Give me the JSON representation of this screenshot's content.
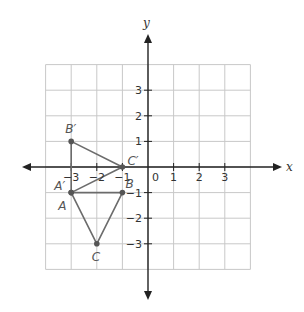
{
  "diagram": {
    "type": "coordinate-plane",
    "axes": {
      "x_label": "x",
      "y_label": "y",
      "origin_label": "0",
      "x_ticks": [
        {
          "value": -3,
          "label": "−3"
        },
        {
          "value": -2,
          "label": "−2"
        },
        {
          "value": -1,
          "label": "−1"
        },
        {
          "value": 1,
          "label": "1"
        },
        {
          "value": 2,
          "label": "2"
        },
        {
          "value": 3,
          "label": "3"
        }
      ],
      "y_ticks": [
        {
          "value": 3,
          "label": "3"
        },
        {
          "value": 2,
          "label": "2"
        },
        {
          "value": 1,
          "label": "1"
        },
        {
          "value": -1,
          "label": "−1"
        },
        {
          "value": -2,
          "label": "−2"
        },
        {
          "value": -3,
          "label": "−3"
        }
      ],
      "grid_range": {
        "x": [
          -4,
          4
        ],
        "y": [
          -4,
          4
        ]
      }
    },
    "points": [
      {
        "name": "A",
        "x": -3,
        "y": -1
      },
      {
        "name": "B",
        "x": -1,
        "y": -1
      },
      {
        "name": "C",
        "x": -2,
        "y": -3
      },
      {
        "name": "A′",
        "x": -3,
        "y": -1
      },
      {
        "name": "B′",
        "x": -3,
        "y": 1
      },
      {
        "name": "C′",
        "x": -1,
        "y": 0
      }
    ],
    "triangles": [
      {
        "name": "ABC",
        "vertices": [
          "A",
          "B",
          "C"
        ]
      },
      {
        "name": "A′B′C′",
        "vertices": [
          "A′",
          "B′",
          "C′"
        ]
      }
    ],
    "colors": {
      "grid": "#c8c8c8",
      "axis": "#222222",
      "shape": "#6b6b6b",
      "point": "#555555"
    }
  }
}
